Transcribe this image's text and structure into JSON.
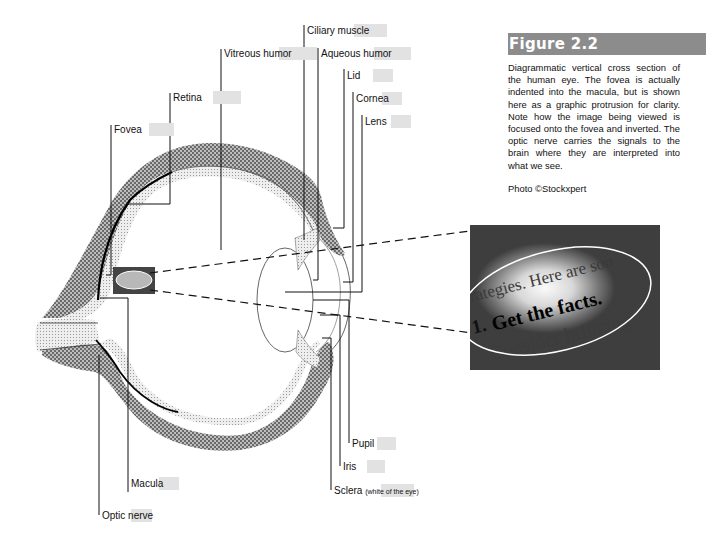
{
  "figure": {
    "title": "Figure 2.2",
    "caption": "Diagrammatic vertical cross section of the human eye. The fovea is actually indented into the macula, but is shown here as a graphic protrusion for clarity. Note how the image being viewed is focused onto the fovea and inverted. The optic nerve carries the signals to the brain where they are interpreted into what we see.",
    "credit": "Photo ©Stockxpert"
  },
  "labels": {
    "fovea": "Fovea",
    "retina": "Retina",
    "vitreous_humor": "Vitreous humor",
    "ciliary_muscle": "Ciliary muscle",
    "aqueous_humor": "Aqueous humor",
    "lid": "Lid",
    "cornea": "Cornea",
    "lens": "Lens",
    "pupil": "Pupil",
    "iris": "Iris",
    "sclera": "Sclera",
    "sclera_note": "(white of the eye)",
    "macula": "Macula",
    "optic_nerve": "Optic nerve"
  },
  "photo": {
    "line1": "rategies. Here are son",
    "line2_num": "1.",
    "line2": "Get the facts.",
    "line3": "Consider bringing"
  },
  "colors": {
    "title_bar": "#8c8c8c",
    "label_bg": "#e2e2e2",
    "hatch": "#9a9a9a",
    "stipple": "#d6d6d6"
  }
}
